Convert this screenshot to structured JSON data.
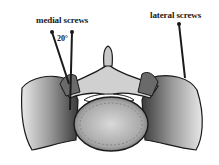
{
  "diagram": {
    "labels": {
      "medial": "medial screws",
      "lateral": "lateral screws",
      "angle": "20°"
    },
    "colors": {
      "background": "#ffffff",
      "ink": "#1a1a1a",
      "bone_shade": "#8a8a8a",
      "bone_light": "#e0e0e0"
    }
  }
}
